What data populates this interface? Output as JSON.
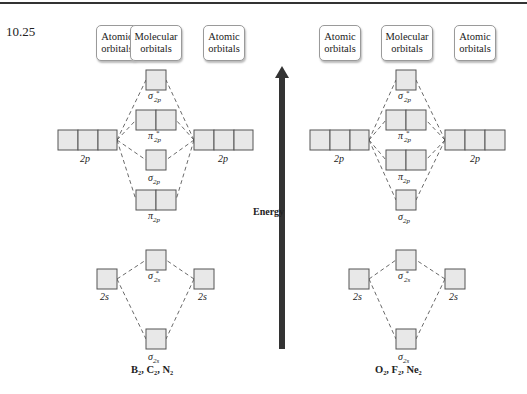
{
  "problem_number": "10.25",
  "headers": {
    "atomic": "Atomic orbitals",
    "molecular": "Molecular orbitals"
  },
  "header_lines": {
    "atomic_1": "Atomic",
    "atomic_2": "orbitals",
    "molecular_1": "Molecular",
    "molecular_2": "orbitals"
  },
  "energy_label": "Energy",
  "left_diagram": {
    "molecules": "B₂, C₂, N₂",
    "mo_order_top_to_bottom": [
      "σ*2p",
      "π*2p",
      "σ2p",
      "π2p",
      "σ*2s",
      "σ2s"
    ],
    "labels": {
      "ao_2p_left": "2p",
      "ao_2p_right": "2p",
      "sigma_star_2p": "σ",
      "pi_star_2p": "π",
      "sigma_2p": "σ",
      "pi_2p": "π",
      "ao_2s_left": "2s",
      "ao_2s_right": "2s",
      "sigma_star_2s": "σ",
      "sigma_2s": "σ"
    }
  },
  "right_diagram": {
    "molecules": "O₂, F₂, Ne₂",
    "mo_order_top_to_bottom": [
      "σ*2p",
      "π*2p",
      "π2p",
      "σ2p",
      "σ*2s",
      "σ2s"
    ],
    "labels": {
      "ao_2p_left": "2p",
      "ao_2p_right": "2p",
      "sigma_star_2p": "σ",
      "pi_star_2p": "π",
      "pi_2p": "π",
      "sigma_2p": "σ",
      "ao_2s_left": "2s",
      "ao_2s_right": "2s",
      "sigma_star_2s": "σ",
      "sigma_2s": "σ"
    }
  },
  "sub": {
    "2p": "2p",
    "2s": "2s",
    "star": "*"
  },
  "colors": {
    "box_fill": "#e8e8e8",
    "box_stroke": "#555555",
    "arrow": "#333333"
  }
}
